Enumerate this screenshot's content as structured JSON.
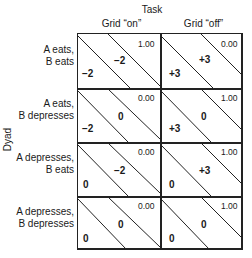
{
  "header": {
    "task_label": "Task",
    "columns": [
      "Grid “on”",
      "Grid “off”"
    ]
  },
  "axis": {
    "dyad_label": "Dyad"
  },
  "rows": [
    {
      "label_line1": "A eats,",
      "label_line2": "B eats",
      "cells": [
        {
          "a": "−2",
          "b": "−2",
          "p": "1.00"
        },
        {
          "a": "+3",
          "b": "+3",
          "p": "0.00"
        }
      ]
    },
    {
      "label_line1": "A eats,",
      "label_line2": "B depresses",
      "cells": [
        {
          "a": "−2",
          "b": "0",
          "p": "0.00"
        },
        {
          "a": "+3",
          "b": "0",
          "p": "1.00"
        }
      ]
    },
    {
      "label_line1": "A depresses,",
      "label_line2": "B eats",
      "cells": [
        {
          "a": "0",
          "b": "−2",
          "p": "0.00"
        },
        {
          "a": "0",
          "b": "+3",
          "p": "1.00"
        }
      ]
    },
    {
      "label_line1": "A depresses,",
      "label_line2": "B depresses",
      "cells": [
        {
          "a": "0",
          "b": "0",
          "p": "0.00"
        },
        {
          "a": "0",
          "b": "0",
          "p": "1.00"
        }
      ]
    }
  ]
}
